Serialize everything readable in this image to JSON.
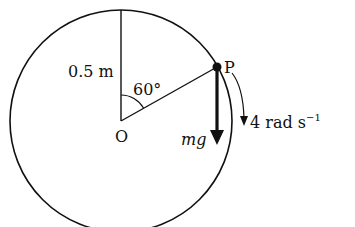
{
  "diagram": {
    "labels": {
      "radius": "0.5 m",
      "angle": "60°",
      "center": "O",
      "point": "P",
      "force": "mg",
      "angular_velocity_value": "4 rad s",
      "angular_velocity_exp": "−1"
    },
    "colors": {
      "stroke": "#111111",
      "background": "#ffffff"
    }
  }
}
